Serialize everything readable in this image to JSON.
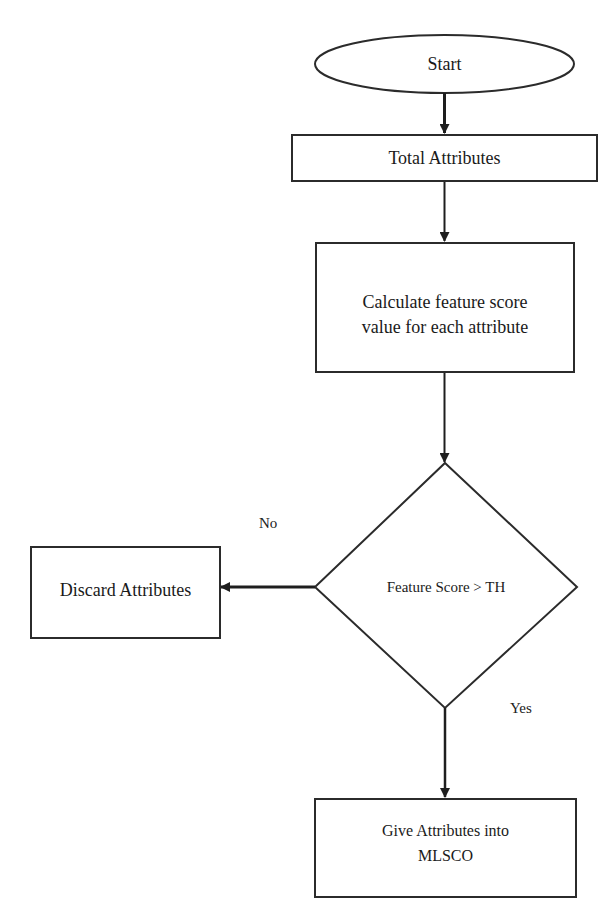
{
  "diagram": {
    "type": "flowchart",
    "nodes": {
      "start": {
        "label": "Start",
        "shape": "ellipse"
      },
      "total_attributes": {
        "label": "Total Attributes",
        "shape": "rectangle"
      },
      "calculate": {
        "label_line1": "Calculate feature score",
        "label_line2": "value for each attribute",
        "shape": "rectangle"
      },
      "decision": {
        "label": "Feature Score > TH",
        "shape": "diamond"
      },
      "discard": {
        "label": "Discard Attributes",
        "shape": "rectangle"
      },
      "give": {
        "label_line1": "Give Attributes into",
        "label_line2": "MLSCO",
        "shape": "rectangle"
      }
    },
    "edges": [
      {
        "from": "start",
        "to": "total_attributes",
        "label": ""
      },
      {
        "from": "total_attributes",
        "to": "calculate",
        "label": ""
      },
      {
        "from": "calculate",
        "to": "decision",
        "label": ""
      },
      {
        "from": "decision",
        "to": "discard",
        "label": "No"
      },
      {
        "from": "decision",
        "to": "give",
        "label": "Yes"
      }
    ],
    "edge_labels": {
      "no": "No",
      "yes": "Yes"
    },
    "colors": {
      "stroke": "#2b2b2b",
      "background": "#ffffff",
      "text": "#1a1a1a"
    }
  }
}
